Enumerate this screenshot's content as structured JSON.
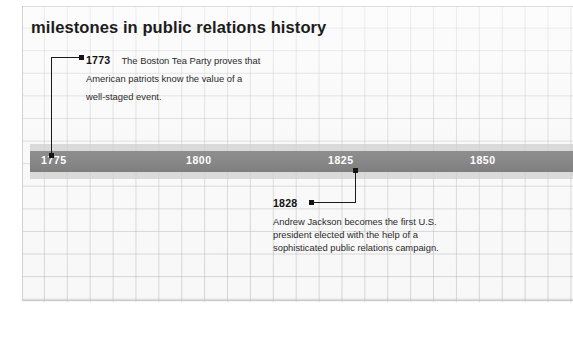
{
  "page": {
    "title": "milestones in public relations history",
    "background_color": "#ffffff",
    "panel_color": "#f7f7f7",
    "grid_line_color": "#b0b0b0"
  },
  "timeline": {
    "bar_color": "#888888",
    "label_color": "#ffffff",
    "years": [
      {
        "label": "1775",
        "x": 41
      },
      {
        "label": "1800",
        "x": 186
      },
      {
        "label": "1825",
        "x": 328
      },
      {
        "label": "1850",
        "x": 470
      }
    ]
  },
  "events": [
    {
      "year": "1773",
      "text": "The Boston Tea Party proves that American patriots know the value of a well-staged event.",
      "position": "above"
    },
    {
      "year": "1828",
      "text": "Andrew Jackson becomes the first U.S. president elected with the help of a sophisticated public relations campaign.",
      "position": "below"
    }
  ]
}
